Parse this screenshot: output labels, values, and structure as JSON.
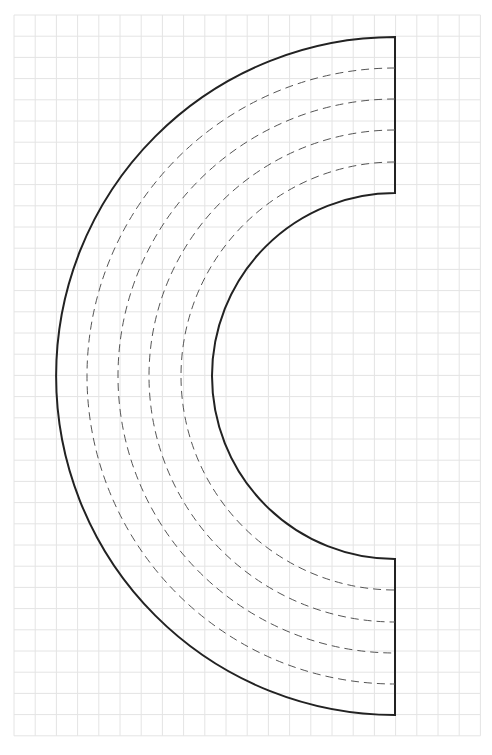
{
  "diagram": {
    "type": "arc-template",
    "grid": {
      "x0": 14,
      "y0": 15,
      "cols": 22,
      "rows": 34,
      "cell": 21.2,
      "color": "#e4e4e4"
    },
    "shape": {
      "center_x": 395,
      "center_y": 376,
      "outer_radius": 339,
      "inner_radius": 183,
      "stroke_color": "#222222",
      "stroke_width": 2,
      "dashed_radii": [
        308,
        277,
        246,
        214
      ],
      "dash_color": "#555555",
      "dash_pattern": "8 5",
      "dash_width": 1
    }
  }
}
